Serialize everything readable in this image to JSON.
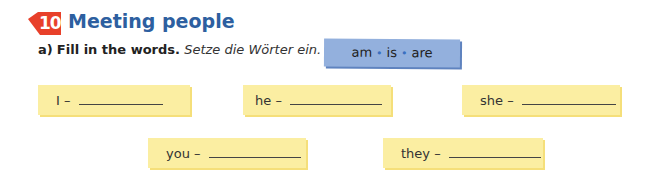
{
  "exercise": {
    "number": "10",
    "title": "Meeting people",
    "badge_color": "#e8402a",
    "title_color": "#2d5fa0"
  },
  "instruction": {
    "label": "a)",
    "english": "Fill in the words.",
    "german": "Setze die Wörter ein."
  },
  "word_box": {
    "words": [
      "am",
      "is",
      "are"
    ],
    "separator": "•"
  },
  "items": [
    {
      "pronoun": "I",
      "dash": "–"
    },
    {
      "pronoun": "he",
      "dash": "–"
    },
    {
      "pronoun": "she",
      "dash": "–"
    },
    {
      "pronoun": "you",
      "dash": "–"
    },
    {
      "pronoun": "they",
      "dash": "–"
    }
  ]
}
